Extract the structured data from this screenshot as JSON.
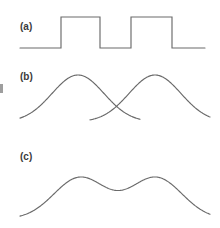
{
  "figure": {
    "background_color": "#ffffff",
    "line_color": "#6a6a6a",
    "label_color": "#3b3b3b",
    "width": 220,
    "height": 228,
    "margin_mark": "cropped-text-fragment"
  },
  "panels": [
    {
      "id": "a",
      "label": "(a)",
      "label_x": 20,
      "label_y": 21,
      "description": "square wave pulse train, two rectangular pulses"
    },
    {
      "id": "b",
      "label": "(b)",
      "label_x": 20,
      "label_y": 71,
      "description": "two overlapping gaussian bumps that cross near the middle"
    },
    {
      "id": "c",
      "label": "(c)",
      "label_x": 20,
      "label_y": 151,
      "description": "sum of the two gaussians, double hump with central dip"
    }
  ],
  "chart_data": [
    {
      "type": "line",
      "panel": "a",
      "title": "(a)",
      "xlabel": "",
      "ylabel": "",
      "xlim": [
        20,
        205
      ],
      "ylim": [
        0,
        1
      ],
      "grid": false,
      "legend": "none",
      "series": [
        {
          "name": "square-wave",
          "waveform": "square",
          "baseline_y_px": 48,
          "top_y_px": 17,
          "amplitude": 1,
          "points": [
            [
              20,
              0
            ],
            [
              61,
              0
            ],
            [
              61,
              1
            ],
            [
              100,
              1
            ],
            [
              100,
              0
            ],
            [
              131,
              0
            ],
            [
              131,
              1
            ],
            [
              172,
              1
            ],
            [
              172,
              0
            ],
            [
              205,
              0
            ]
          ]
        }
      ]
    },
    {
      "type": "line",
      "panel": "b",
      "title": "(b)",
      "xlabel": "",
      "ylabel": "",
      "xlim": [
        20,
        205
      ],
      "ylim": [
        0,
        1
      ],
      "grid": false,
      "legend": "none",
      "crossing_point_px": [
        115,
        110
      ],
      "series": [
        {
          "name": "gaussian-left",
          "waveform": "gaussian",
          "center_x_px": 78,
          "peak_y_px": 75,
          "baseline_y_px": 122,
          "sigma_px": 26,
          "x_start_px": 20,
          "x_end_px": 140,
          "amplitude": 1
        },
        {
          "name": "gaussian-right",
          "waveform": "gaussian",
          "center_x_px": 155,
          "peak_y_px": 75,
          "baseline_y_px": 122,
          "sigma_px": 26,
          "x_start_px": 90,
          "x_end_px": 210,
          "amplitude": 1
        }
      ]
    },
    {
      "type": "line",
      "panel": "c",
      "title": "(c)",
      "xlabel": "",
      "ylabel": "",
      "xlim": [
        20,
        205
      ],
      "ylim": [
        0,
        1
      ],
      "grid": false,
      "legend": "none",
      "series": [
        {
          "name": "gaussian-sum",
          "waveform": "sum-of-gaussians",
          "peak1_px": [
            80,
            177
          ],
          "peak2_px": [
            156,
            177
          ],
          "dip_px": [
            117,
            196
          ],
          "baseline_y_px": 219,
          "sigma_px": 26,
          "x_start_px": 20,
          "x_end_px": 210,
          "amplitude": 1
        }
      ]
    }
  ]
}
